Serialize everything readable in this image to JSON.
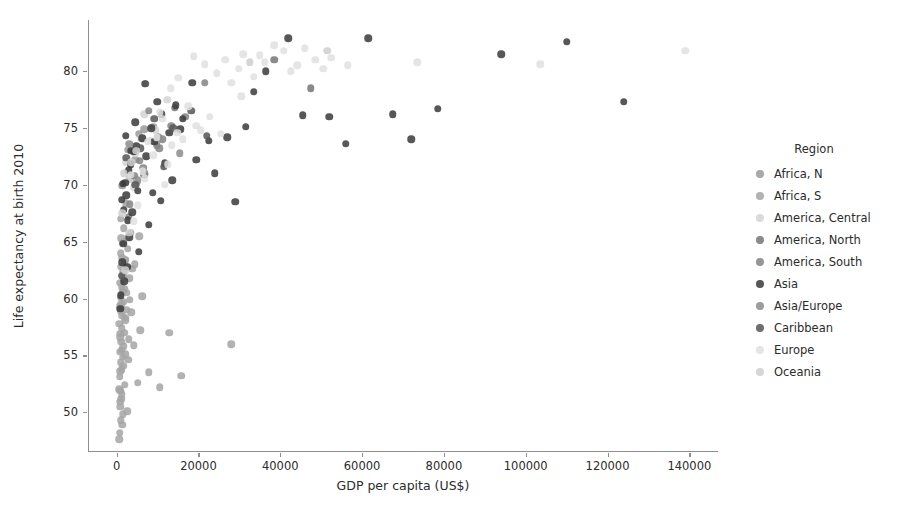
{
  "chart_data": {
    "type": "scatter",
    "title": "",
    "xlabel": "GDP per capita (US$)",
    "ylabel": "Life expectancy at birth 2010",
    "xlim": [
      -7000,
      147000
    ],
    "ylim": [
      46.5,
      84.5
    ],
    "xticks": [
      0,
      20000,
      40000,
      60000,
      80000,
      100000,
      120000,
      140000
    ],
    "xtick_labels": [
      "0",
      "20000",
      "40000",
      "60000",
      "80000",
      "100000",
      "120000",
      "140000"
    ],
    "yticks": [
      50,
      55,
      60,
      65,
      70,
      75,
      80
    ],
    "ytick_labels": [
      "50",
      "55",
      "60",
      "65",
      "70",
      "75",
      "80"
    ],
    "grid": false,
    "legend_position": "right",
    "legend_title": "Region",
    "marker_size_px": 7.5,
    "marker_opacity": 0.85,
    "series": [
      {
        "name": "Africa, N",
        "color": "#9a9a9a",
        "points": [
          [
            4500,
            72.2
          ],
          [
            2800,
            73.1
          ],
          [
            5400,
            74.5
          ],
          [
            1400,
            69.9
          ],
          [
            3300,
            70.6
          ],
          [
            6800,
            74.9
          ],
          [
            2100,
            63.4
          ],
          [
            8900,
            75.1
          ]
        ]
      },
      {
        "name": "Africa, S",
        "color": "#a5a5a5",
        "points": [
          [
            600,
            47.6
          ],
          [
            750,
            48.2
          ],
          [
            900,
            50.5
          ],
          [
            1100,
            51.2
          ],
          [
            650,
            52.0
          ],
          [
            820,
            53.1
          ],
          [
            1300,
            53.8
          ],
          [
            980,
            54.4
          ],
          [
            1450,
            54.9
          ],
          [
            700,
            55.3
          ],
          [
            1600,
            55.8
          ],
          [
            1150,
            56.2
          ],
          [
            890,
            56.6
          ],
          [
            1850,
            57.0
          ],
          [
            1250,
            57.4
          ],
          [
            620,
            57.8
          ],
          [
            2100,
            58.1
          ],
          [
            1400,
            58.5
          ],
          [
            980,
            58.9
          ],
          [
            760,
            59.3
          ],
          [
            1700,
            59.7
          ],
          [
            1050,
            60.1
          ],
          [
            2400,
            60.5
          ],
          [
            1300,
            61.0
          ],
          [
            850,
            61.4
          ],
          [
            3100,
            61.8
          ],
          [
            1600,
            62.3
          ],
          [
            1150,
            62.8
          ],
          [
            2000,
            63.2
          ],
          [
            1350,
            63.6
          ],
          [
            950,
            64.0
          ],
          [
            2700,
            64.4
          ],
          [
            1500,
            64.9
          ],
          [
            1180,
            65.3
          ],
          [
            3600,
            58.8
          ],
          [
            4200,
            55.9
          ],
          [
            2900,
            56.4
          ],
          [
            5100,
            52.6
          ],
          [
            7800,
            53.5
          ],
          [
            10500,
            52.2
          ],
          [
            1050,
            49.3
          ],
          [
            880,
            50.9
          ],
          [
            1250,
            51.6
          ],
          [
            1650,
            54.1
          ],
          [
            2300,
            59.0
          ],
          [
            1900,
            60.8
          ],
          [
            1420,
            62.0
          ],
          [
            3400,
            65.8
          ],
          [
            5800,
            57.2
          ],
          [
            2600,
            50.1
          ],
          [
            1750,
            66.2
          ],
          [
            980,
            67.0
          ],
          [
            2250,
            68.4
          ],
          [
            4800,
            70.1
          ],
          [
            12800,
            57.0
          ],
          [
            1380,
            48.9
          ],
          [
            6200,
            60.2
          ],
          [
            870,
            53.6
          ],
          [
            1520,
            49.8
          ],
          [
            2050,
            55.1
          ],
          [
            28000,
            56.0
          ],
          [
            3800,
            62.6
          ],
          [
            1120,
            59.5
          ],
          [
            2850,
            54.6
          ],
          [
            4400,
            63.0
          ],
          [
            1680,
            65.0
          ],
          [
            920,
            51.9
          ],
          [
            2150,
            58.3
          ],
          [
            1280,
            55.5
          ],
          [
            3250,
            59.9
          ],
          [
            15800,
            53.2
          ],
          [
            5500,
            65.5
          ],
          [
            1950,
            52.4
          ],
          [
            1480,
            60.6
          ],
          [
            830,
            56.9
          ]
        ]
      },
      {
        "name": "America, Central",
        "color": "#d4d4d4",
        "points": [
          [
            2800,
            71.2
          ],
          [
            4600,
            72.8
          ],
          [
            8200,
            73.9
          ],
          [
            3100,
            70.5
          ],
          [
            5900,
            74.1
          ],
          [
            6800,
            76.2
          ],
          [
            12400,
            77.5
          ],
          [
            2400,
            72.0
          ],
          [
            9500,
            74.8
          ],
          [
            4200,
            69.8
          ]
        ]
      },
      {
        "name": "America, North",
        "color": "#767676",
        "points": [
          [
            47500,
            78.5
          ],
          [
            38500,
            81.0
          ],
          [
            14200,
            76.8
          ]
        ]
      },
      {
        "name": "America, South",
        "color": "#848484",
        "points": [
          [
            9800,
            73.5
          ],
          [
            13400,
            75.2
          ],
          [
            11200,
            74.0
          ],
          [
            5600,
            72.1
          ],
          [
            4300,
            70.8
          ],
          [
            7900,
            76.5
          ],
          [
            16800,
            76.0
          ],
          [
            3200,
            68.3
          ],
          [
            21500,
            79.0
          ],
          [
            10400,
            73.2
          ],
          [
            6500,
            71.5
          ],
          [
            2900,
            67.2
          ]
        ]
      },
      {
        "name": "Asia",
        "color": "#3a3a3a",
        "points": [
          [
            1200,
            68.7
          ],
          [
            2100,
            70.2
          ],
          [
            3400,
            71.8
          ],
          [
            4800,
            73.4
          ],
          [
            6200,
            74.1
          ],
          [
            8500,
            75.0
          ],
          [
            11000,
            76.2
          ],
          [
            14500,
            77.0
          ],
          [
            18500,
            79.0
          ],
          [
            7200,
            72.5
          ],
          [
            2700,
            66.9
          ],
          [
            1600,
            64.8
          ],
          [
            5100,
            69.5
          ],
          [
            9200,
            73.8
          ],
          [
            3800,
            67.6
          ],
          [
            1350,
            63.2
          ],
          [
            12800,
            74.6
          ],
          [
            6700,
            70.9
          ],
          [
            2350,
            69.1
          ],
          [
            16200,
            75.8
          ],
          [
            4200,
            72.9
          ],
          [
            1850,
            61.5
          ],
          [
            10800,
            68.6
          ],
          [
            3100,
            65.4
          ],
          [
            22500,
            73.9
          ],
          [
            27000,
            74.2
          ],
          [
            31500,
            75.1
          ],
          [
            42000,
            82.9
          ],
          [
            36500,
            80.0
          ],
          [
            52000,
            76.0
          ],
          [
            61500,
            82.9
          ],
          [
            56000,
            73.6
          ],
          [
            78500,
            76.7
          ],
          [
            94000,
            81.5
          ],
          [
            110000,
            82.6
          ],
          [
            124000,
            77.3
          ],
          [
            67500,
            76.2
          ],
          [
            72000,
            74.0
          ],
          [
            45500,
            76.1
          ],
          [
            29000,
            68.5
          ],
          [
            1050,
            60.3
          ],
          [
            2550,
            62.8
          ],
          [
            880,
            59.1
          ],
          [
            7800,
            66.5
          ],
          [
            19500,
            72.2
          ],
          [
            13600,
            70.4
          ],
          [
            5400,
            64.1
          ],
          [
            3600,
            73.0
          ],
          [
            9900,
            77.3
          ],
          [
            24000,
            71.0
          ],
          [
            1550,
            70.1
          ],
          [
            4500,
            75.5
          ],
          [
            33500,
            78.2
          ],
          [
            2250,
            74.3
          ],
          [
            6900,
            78.9
          ],
          [
            8800,
            69.3
          ],
          [
            15500,
            74.9
          ],
          [
            11800,
            71.9
          ],
          [
            2950,
            71.3
          ],
          [
            1750,
            67.8
          ]
        ]
      },
      {
        "name": "Asia/Europe",
        "color": "#8c8c8c",
        "points": [
          [
            10200,
            74.2
          ],
          [
            5200,
            70.4
          ],
          [
            15400,
            72.8
          ],
          [
            3100,
            73.6
          ],
          [
            6800,
            71.0
          ]
        ]
      },
      {
        "name": "Caribbean",
        "color": "#565656",
        "points": [
          [
            5800,
            73.2
          ],
          [
            9200,
            75.8
          ],
          [
            13800,
            75.0
          ],
          [
            2300,
            72.4
          ],
          [
            7100,
            78.9
          ],
          [
            1200,
            62.0
          ],
          [
            4500,
            70.0
          ],
          [
            22000,
            74.3
          ],
          [
            18200,
            76.5
          ],
          [
            11500,
            71.6
          ]
        ]
      },
      {
        "name": "Europe",
        "color": "#e0e0e0",
        "points": [
          [
            48500,
            81.0
          ],
          [
            44200,
            80.5
          ],
          [
            52500,
            81.2
          ],
          [
            40800,
            81.8
          ],
          [
            36200,
            80.8
          ],
          [
            33500,
            79.5
          ],
          [
            29800,
            80.2
          ],
          [
            26500,
            81.0
          ],
          [
            22800,
            76.0
          ],
          [
            19500,
            75.2
          ],
          [
            16200,
            74.0
          ],
          [
            13500,
            73.5
          ],
          [
            11200,
            75.8
          ],
          [
            14800,
            74.6
          ],
          [
            38500,
            82.3
          ],
          [
            56500,
            80.5
          ],
          [
            42500,
            80.0
          ],
          [
            31000,
            81.5
          ],
          [
            24500,
            79.8
          ],
          [
            20500,
            74.8
          ],
          [
            17500,
            76.9
          ],
          [
            9800,
            74.2
          ],
          [
            12500,
            71.8
          ],
          [
            7600,
            73.8
          ],
          [
            6400,
            71.2
          ],
          [
            46000,
            82.0
          ],
          [
            50500,
            80.2
          ],
          [
            35000,
            81.4
          ],
          [
            28000,
            79.0
          ],
          [
            21500,
            80.6
          ],
          [
            73500,
            80.8
          ],
          [
            103500,
            80.6
          ],
          [
            139000,
            81.8
          ],
          [
            11800,
            70.0
          ],
          [
            8900,
            72.6
          ],
          [
            18800,
            81.3
          ],
          [
            25500,
            74.5
          ],
          [
            15000,
            79.4
          ],
          [
            10500,
            76.4
          ],
          [
            30500,
            77.8
          ],
          [
            6900,
            70.6
          ],
          [
            5100,
            68.2
          ],
          [
            4200,
            66.8
          ],
          [
            3500,
            70.9
          ],
          [
            13200,
            78.5
          ]
        ]
      },
      {
        "name": "Oceania",
        "color": "#cfcfcf",
        "points": [
          [
            51500,
            81.8
          ],
          [
            32500,
            80.8
          ],
          [
            2100,
            62.5
          ],
          [
            1400,
            67.5
          ],
          [
            3600,
            72.0
          ],
          [
            3100,
            65.8
          ],
          [
            1700,
            71.0
          ],
          [
            4800,
            73.0
          ]
        ]
      }
    ]
  }
}
